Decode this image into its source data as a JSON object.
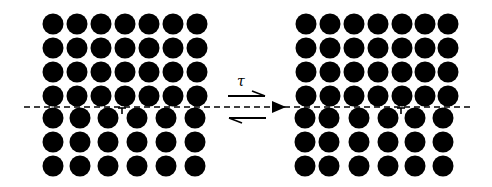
{
  "diagram": {
    "stress_label": "τ",
    "colors": {
      "atom": "#000000",
      "background": "#ffffff",
      "slip_plane": "#000000"
    },
    "left_lattice": {
      "upper_rows_y": [
        24,
        48,
        72,
        96
      ],
      "upper_cols_x": [
        53,
        77,
        101,
        125,
        149,
        173,
        197
      ],
      "lower_rows_y": [
        118,
        142,
        166
      ],
      "lower_cols_x": [
        53,
        80,
        108,
        137,
        166,
        195
      ],
      "dislocation_symbol": "⊥",
      "dislocation_x": 122
    },
    "right_lattice": {
      "upper_rows_y": [
        24,
        48,
        72,
        96
      ],
      "upper_cols_x": [
        306,
        330,
        354,
        378,
        402,
        425,
        448
      ],
      "lower_rows_y": [
        118,
        142,
        166
      ],
      "lower_cols_x": [
        305,
        329,
        359,
        388,
        415,
        443
      ],
      "dislocation_symbol": "⊥",
      "dislocation_x": 401
    },
    "atom_radius": 10.5,
    "slip_plane_y": 107
  }
}
